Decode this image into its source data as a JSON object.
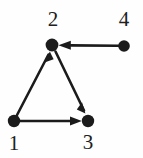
{
  "figure": {
    "type": "directed-graph",
    "background_color": "#fefefe",
    "ink_color": "#1b1b1b",
    "width": 143,
    "height": 158,
    "node_radius": 6,
    "nodes": [
      {
        "id": "1",
        "label": "1",
        "x": 14,
        "y": 121,
        "label_x": 14,
        "label_y": 145
      },
      {
        "id": "2",
        "label": "2",
        "x": 52,
        "y": 45,
        "label_x": 53,
        "label_y": 21
      },
      {
        "id": "3",
        "label": "3",
        "x": 88,
        "y": 121,
        "label_x": 88,
        "label_y": 144
      },
      {
        "id": "4",
        "label": "4",
        "x": 124,
        "y": 46,
        "label_x": 124,
        "label_y": 21
      }
    ],
    "edges": [
      {
        "id": "e-1-2",
        "from": "1",
        "to": "2",
        "directed": true,
        "arrow": "end"
      },
      {
        "id": "e-1-3",
        "from": "1",
        "to": "3",
        "directed": true,
        "arrow": "end"
      },
      {
        "id": "e-2-3",
        "from": "2",
        "to": "3",
        "directed": true,
        "arrow": "end"
      },
      {
        "id": "e-4-2",
        "from": "4",
        "to": "2",
        "directed": true,
        "arrow": "end"
      }
    ]
  }
}
